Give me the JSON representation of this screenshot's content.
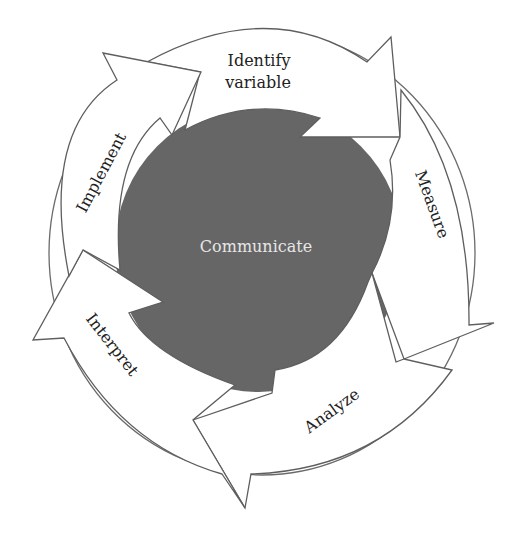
{
  "diagram": {
    "type": "cycle",
    "center_label": "Communicate",
    "steps": [
      {
        "label_line1": "Identify",
        "label_line2": "variable"
      },
      {
        "label": "Measure"
      },
      {
        "label": "Analyze"
      },
      {
        "label": "Interpret"
      },
      {
        "label": "Implement"
      }
    ],
    "colors": {
      "core": "#666666",
      "arrow_fill": "#ffffff",
      "arrow_stroke": "#5e5e5e",
      "center_text": "#e6e6e6",
      "label_text": "#222222"
    }
  }
}
